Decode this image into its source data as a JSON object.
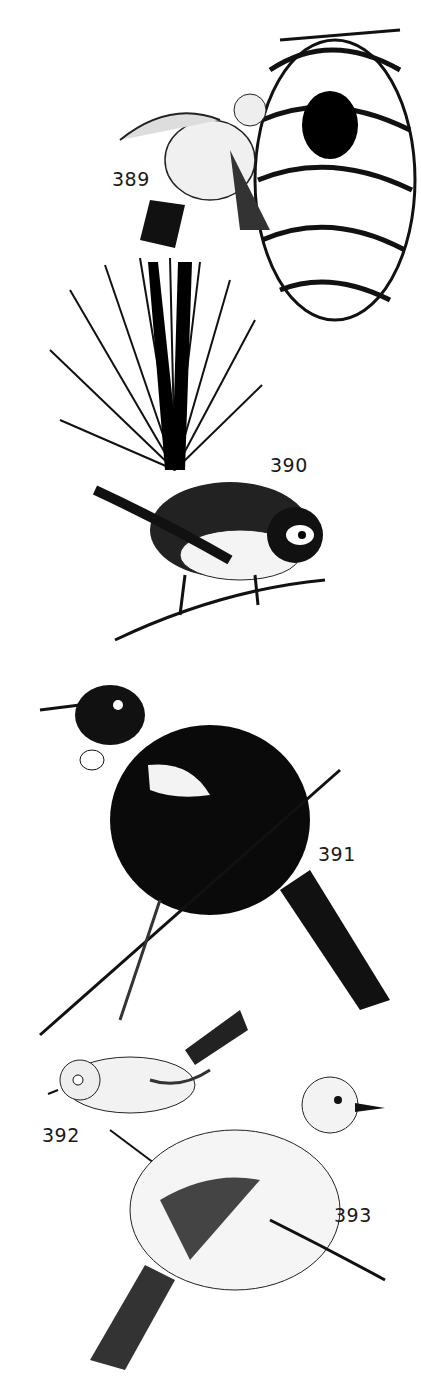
{
  "figure": {
    "type": "black-and-white bird illustration plate",
    "labels": [
      {
        "id": "389",
        "text": "389",
        "subject": "small bird at hanging woven nest",
        "x": 112,
        "y": 168
      },
      {
        "id": "390",
        "text": "390",
        "subject": "fantail bird with spread fan tail on branch",
        "x": 270,
        "y": 454
      },
      {
        "id": "391",
        "text": "391",
        "subject": "dark bird with white throat tufts on branch",
        "x": 318,
        "y": 843
      },
      {
        "id": "392",
        "text": "392",
        "subject": "small bird with eye-ring on branch",
        "x": 42,
        "y": 1124
      },
      {
        "id": "393",
        "text": "393",
        "subject": "pale stippled bird on branch",
        "x": 334,
        "y": 1204
      }
    ]
  }
}
